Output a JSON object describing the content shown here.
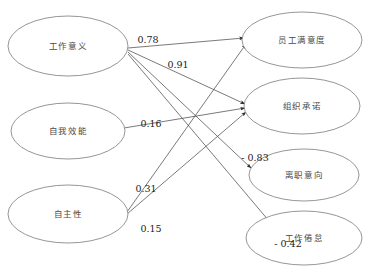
{
  "diagram": {
    "type": "path-diagram",
    "nodes": [
      {
        "id": "work_meaning",
        "label": "工作意义",
        "column": "left",
        "cx": 68,
        "cy": 46,
        "rx": 60,
        "ry": 30
      },
      {
        "id": "self_efficacy",
        "label": "自我效能",
        "column": "left",
        "cx": 68,
        "cy": 131,
        "rx": 57,
        "ry": 28
      },
      {
        "id": "autonomy",
        "label": "自主性",
        "column": "left",
        "cx": 68,
        "cy": 214,
        "rx": 60,
        "ry": 29
      },
      {
        "id": "satisfaction",
        "label": "员工满意度",
        "column": "right",
        "cx": 302,
        "cy": 40,
        "rx": 60,
        "ry": 28
      },
      {
        "id": "commitment",
        "label": "组织承诺",
        "column": "right",
        "cx": 302,
        "cy": 106,
        "rx": 58,
        "ry": 28
      },
      {
        "id": "turnover",
        "label": "离职意向",
        "column": "right",
        "cx": 304,
        "cy": 175,
        "rx": 55,
        "ry": 26
      },
      {
        "id": "burnout",
        "label": "工作倦怠",
        "column": "right",
        "cx": 304,
        "cy": 238,
        "rx": 58,
        "ry": 27
      }
    ],
    "edges": [
      {
        "id": "e1",
        "from": "work_meaning",
        "to": "satisfaction",
        "coefficient": "0.78",
        "label_x": 148,
        "label_y": 40,
        "x1": 128,
        "y1": 48,
        "x2": 244,
        "y2": 38
      },
      {
        "id": "e2",
        "from": "work_meaning",
        "to": "commitment",
        "coefficient": "0.91",
        "label_x": 178,
        "label_y": 65,
        "x1": 128,
        "y1": 50,
        "x2": 245,
        "y2": 104
      },
      {
        "id": "e3",
        "from": "work_meaning",
        "to": "turnover",
        "coefficient": "- 0.83",
        "label_x": 255,
        "label_y": 158,
        "x1": 128,
        "y1": 52,
        "x2": 251,
        "y2": 168
      },
      {
        "id": "e4",
        "from": "work_meaning",
        "to": "burnout",
        "coefficient": "- 0.42",
        "label_x": 288,
        "label_y": 244,
        "x1": 128,
        "y1": 54,
        "x2": 280,
        "y2": 234
      },
      {
        "id": "e5",
        "from": "self_efficacy",
        "to": "commitment",
        "coefficient": "0.16",
        "label_x": 151,
        "label_y": 124,
        "x1": 124,
        "y1": 128,
        "x2": 245,
        "y2": 108
      },
      {
        "id": "e6",
        "from": "autonomy",
        "to": "satisfaction",
        "coefficient": "0.31",
        "label_x": 146,
        "label_y": 189,
        "x1": 127,
        "y1": 212,
        "x2": 246,
        "y2": 44
      },
      {
        "id": "e7",
        "from": "autonomy",
        "to": "commitment",
        "coefficient": "0.15",
        "label_x": 151,
        "label_y": 229,
        "x1": 127,
        "y1": 214,
        "x2": 246,
        "y2": 112
      }
    ]
  }
}
